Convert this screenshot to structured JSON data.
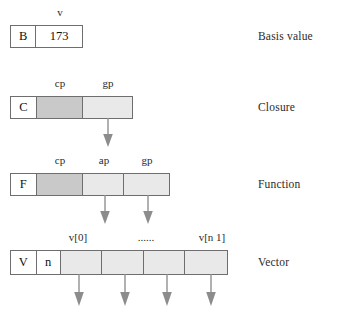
{
  "diagram": {
    "colors": {
      "border": "#6e6e6e",
      "cell_dark": "#c9c9c9",
      "cell_light": "#e9e9e9",
      "cell_white": "#ffffff",
      "arrow": "#8c8c8c",
      "text": "#1a1a1a",
      "background": "#ffffff"
    },
    "rows": [
      {
        "id": "basis-value",
        "right_label": "Basis value",
        "top_labels": [
          {
            "text": "v",
            "x": 60
          }
        ],
        "cells": [
          {
            "name": "tag",
            "text": "B",
            "fill": "white",
            "x": 10,
            "width": 26
          },
          {
            "name": "value",
            "text": "173",
            "fill": "white",
            "x": 36,
            "width": 47
          }
        ],
        "arrows": []
      },
      {
        "id": "closure",
        "right_label": "Closure",
        "top_labels": [
          {
            "text": "cp",
            "x": 60
          },
          {
            "text": "gp",
            "x": 108
          }
        ],
        "cells": [
          {
            "name": "tag",
            "text": "C",
            "fill": "white",
            "x": 10,
            "width": 26
          },
          {
            "name": "cp",
            "text": "",
            "fill": "dark",
            "x": 36,
            "width": 47
          },
          {
            "name": "gp",
            "text": "",
            "fill": "light",
            "x": 83,
            "width": 50
          }
        ],
        "arrows": [
          {
            "x": 107
          }
        ]
      },
      {
        "id": "function",
        "right_label": "Function",
        "top_labels": [
          {
            "text": "cp",
            "x": 60
          },
          {
            "text": "ap",
            "x": 104
          },
          {
            "text": "gp",
            "x": 147
          }
        ],
        "cells": [
          {
            "name": "tag",
            "text": "F",
            "fill": "white",
            "x": 10,
            "width": 26
          },
          {
            "name": "cp",
            "text": "",
            "fill": "dark",
            "x": 36,
            "width": 47
          },
          {
            "name": "ap",
            "text": "",
            "fill": "light",
            "x": 83,
            "width": 41
          },
          {
            "name": "gp",
            "text": "",
            "fill": "light",
            "x": 124,
            "width": 46
          }
        ],
        "arrows": [
          {
            "x": 104
          },
          {
            "x": 147
          }
        ]
      },
      {
        "id": "vector",
        "right_label": "Vector",
        "top_labels": [
          {
            "text": "v[0]",
            "x": 78
          },
          {
            "text": "......",
            "x": 146
          },
          {
            "text": "v[n 1]",
            "x": 212
          }
        ],
        "cells": [
          {
            "name": "tag",
            "text": "V",
            "fill": "white",
            "x": 10,
            "width": 26
          },
          {
            "name": "count",
            "text": "n",
            "fill": "white",
            "x": 36,
            "width": 24
          },
          {
            "name": "elem-0",
            "text": "",
            "fill": "light",
            "x": 60,
            "width": 42
          },
          {
            "name": "elem-1",
            "text": "",
            "fill": "light",
            "x": 102,
            "width": 42
          },
          {
            "name": "elem-2",
            "text": "",
            "fill": "light",
            "x": 144,
            "width": 42
          },
          {
            "name": "elem-3",
            "text": "",
            "fill": "light",
            "x": 186,
            "width": 42
          }
        ],
        "arrows": [
          {
            "x": 78
          },
          {
            "x": 124
          },
          {
            "x": 166
          },
          {
            "x": 210
          }
        ]
      }
    ]
  }
}
